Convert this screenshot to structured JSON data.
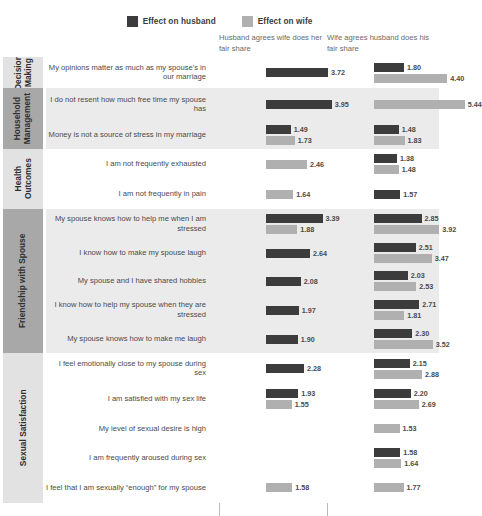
{
  "legend": {
    "items": [
      {
        "label": "Effect on husband",
        "color": "#3c3c3c",
        "key": "husband"
      },
      {
        "label": "Effect on wife",
        "color": "#b0b0b0",
        "key": "wife"
      }
    ]
  },
  "columns": [
    {
      "title": "Husband agrees wife does her fair share"
    },
    {
      "title": "Wife agrees husband does his fair share"
    }
  ],
  "chart_data": {
    "type": "bar",
    "orientation": "horizontal",
    "title": "",
    "xlabel": "",
    "ylabel": "",
    "xlim": [
      0,
      6
    ],
    "grid": false,
    "legend_position": "top-center",
    "panels": [
      "Husband agrees wife does her fair share",
      "Wife agrees husband does his fair share"
    ],
    "series": [
      {
        "name": "Effect on husband",
        "color": "#3c3c3c"
      },
      {
        "name": "Effect on wife",
        "color": "#b0b0b0"
      }
    ],
    "groups": [
      {
        "category": "Decision Making",
        "shaded": false,
        "rows": [
          {
            "statement": "My opinions matter as much as my spouse's in our marriage",
            "panel1": {
              "husband": 3.72,
              "wife": null
            },
            "panel2": {
              "husband": 1.8,
              "wife": 4.4
            }
          }
        ]
      },
      {
        "category": "Household Management",
        "shaded": true,
        "rows": [
          {
            "statement": "I do not resent how much free time my spouse has",
            "panel1": {
              "husband": 3.95,
              "wife": null
            },
            "panel2": {
              "husband": null,
              "wife": 5.44
            }
          },
          {
            "statement": "Money is not a source of stress in my marriage",
            "panel1": {
              "husband": 1.49,
              "wife": 1.73
            },
            "panel2": {
              "husband": 1.48,
              "wife": 1.83
            }
          }
        ]
      },
      {
        "category": "Health Outcomes",
        "shaded": false,
        "rows": [
          {
            "statement": "I am not frequently exhausted",
            "panel1": {
              "husband": null,
              "wife": 2.46
            },
            "panel2": {
              "husband": 1.38,
              "wife": 1.48
            }
          },
          {
            "statement": "I am not frequently in pain",
            "panel1": {
              "husband": null,
              "wife": 1.64
            },
            "panel2": {
              "husband": 1.57,
              "wife": null
            }
          }
        ]
      },
      {
        "category": "Friendship with Spouse",
        "shaded": true,
        "rows": [
          {
            "statement": "My spouse knows how to help me when I am stressed",
            "panel1": {
              "husband": 3.39,
              "wife": 1.88
            },
            "panel2": {
              "husband": 2.85,
              "wife": 3.92
            }
          },
          {
            "statement": "I know how to make my spouse laugh",
            "panel1": {
              "husband": 2.64,
              "wife": null
            },
            "panel2": {
              "husband": 2.51,
              "wife": 3.47
            }
          },
          {
            "statement": "My spouse and I have shared hobbies",
            "panel1": {
              "husband": 2.08,
              "wife": null
            },
            "panel2": {
              "husband": 2.03,
              "wife": 2.53
            }
          },
          {
            "statement": "I know how to help my spouse when they are stressed",
            "panel1": {
              "husband": 1.97,
              "wife": null
            },
            "panel2": {
              "husband": 2.71,
              "wife": 1.81
            }
          },
          {
            "statement": "My spouse knows how to make me laugh",
            "panel1": {
              "husband": 1.9,
              "wife": null
            },
            "panel2": {
              "husband": 2.3,
              "wife": 3.52
            }
          }
        ]
      },
      {
        "category": "Sexual Satisfaction",
        "shaded": false,
        "rows": [
          {
            "statement": "I feel emotionally close to my spouse during sex",
            "panel1": {
              "husband": 2.28,
              "wife": null
            },
            "panel2": {
              "husband": 2.15,
              "wife": 2.88
            }
          },
          {
            "statement": "I am satisfied with my sex life",
            "panel1": {
              "husband": 1.93,
              "wife": 1.55
            },
            "panel2": {
              "husband": 2.2,
              "wife": 2.69
            }
          },
          {
            "statement": "My level of sexual desire is high",
            "panel1": {
              "husband": null,
              "wife": null
            },
            "panel2": {
              "husband": null,
              "wife": 1.53
            }
          },
          {
            "statement": "I am frequently aroused during sex",
            "panel1": {
              "husband": null,
              "wife": null
            },
            "panel2": {
              "husband": 1.58,
              "wife": 1.64
            }
          },
          {
            "statement": "I feel that I am sexually “enough” for my spouse",
            "panel1": {
              "husband": null,
              "wife": 1.58
            },
            "panel2": {
              "husband": null,
              "wife": 1.77
            }
          }
        ]
      }
    ]
  }
}
